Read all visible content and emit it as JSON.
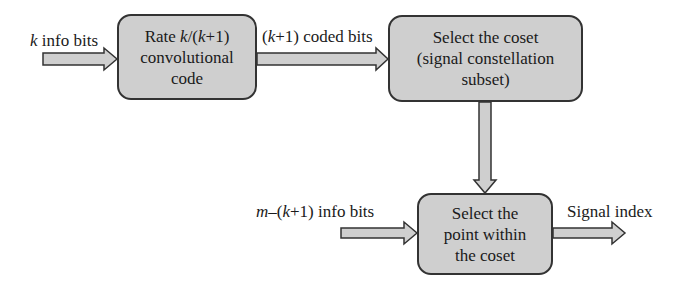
{
  "diagram": {
    "type": "block-diagram",
    "blocks": [
      {
        "id": "conv_code",
        "lines": [
          "Rate k/(k+1)",
          "convolutional",
          "code"
        ]
      },
      {
        "id": "select_coset",
        "lines": [
          "Select the coset",
          "(signal constellation",
          "subset)"
        ]
      },
      {
        "id": "select_point",
        "lines": [
          "Select the",
          "point within",
          "the coset"
        ]
      }
    ],
    "labels": {
      "k_info_bits": {
        "var": "k",
        "text": " info bits"
      },
      "coded_bits": {
        "pre": "(",
        "var": "k",
        "post": "+1) coded bits"
      },
      "m_info_bits": {
        "var": "m",
        "mid": "–(",
        "var2": "k",
        "post": "+1) info bits"
      },
      "signal_index": "Signal index"
    },
    "rate_label": {
      "pre": "Rate ",
      "var1": "k",
      "mid": "/(",
      "var2": "k",
      "post": "+1)"
    },
    "edges": [
      {
        "from": "input_k",
        "to": "conv_code",
        "label": "k info bits"
      },
      {
        "from": "conv_code",
        "to": "select_coset",
        "label": "(k+1) coded bits"
      },
      {
        "from": "select_coset",
        "to": "select_point",
        "label": ""
      },
      {
        "from": "input_m",
        "to": "select_point",
        "label": "m-(k+1) info bits"
      },
      {
        "from": "select_point",
        "to": "output",
        "label": "Signal index"
      }
    ],
    "colors": {
      "box_fill": "#cfcfcf",
      "box_stroke": "#333333",
      "arrow_fill": "#cfcfcf",
      "arrow_stroke": "#333333"
    }
  }
}
